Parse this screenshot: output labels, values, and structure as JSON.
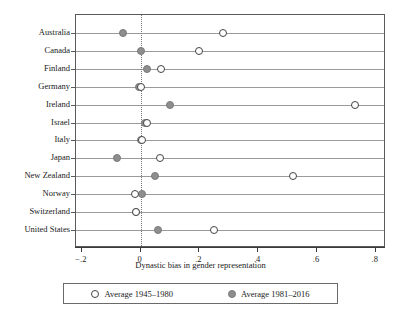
{
  "chart_data": {
    "type": "scatter",
    "title": "",
    "xlabel": "Dynastic bias in gender representation",
    "ylabel": "",
    "xlim": [
      -0.22,
      0.835
    ],
    "grid": true,
    "legend_position": "bottom",
    "categories": [
      "Australia",
      "Canada",
      "Finland",
      "Germany",
      "Ireland",
      "Israel",
      "Italy",
      "Japan",
      "New Zealand",
      "Norway",
      "Switzerland",
      "United States"
    ],
    "series": [
      {
        "name": "Average 1945–1980",
        "marker": "open-circle",
        "color": "#ffffff",
        "edge_color": "#444444",
        "values": [
          0.28,
          0.2,
          0.07,
          0.0,
          0.73,
          0.02,
          0.005,
          0.065,
          0.52,
          -0.02,
          -0.015,
          0.25
        ]
      },
      {
        "name": "Average 1981–2016",
        "marker": "filled-circle",
        "color": "#8e8e8e",
        "edge_color": "#7a7a7a",
        "values": [
          -0.06,
          0.0,
          0.02,
          -0.005,
          0.1,
          0.015,
          0.0,
          -0.08,
          0.05,
          0.005,
          -0.015,
          0.06
        ]
      }
    ],
    "xticks": [
      -0.2,
      0,
      0.2,
      0.4,
      0.6,
      0.8
    ],
    "xticklabels": [
      "−.2",
      "0",
      ".2",
      ".4",
      ".6",
      ".8"
    ],
    "reference_line": {
      "value": 0,
      "style": "dotted",
      "color": "#777777"
    }
  },
  "legend": {
    "entries": [
      {
        "label": "Average 1945–1980",
        "marker": "open-circle"
      },
      {
        "label": "Average 1981–2016",
        "marker": "filled-circle"
      }
    ]
  },
  "colors": {
    "frame": "#5a5a5a",
    "row_line": "#9a9a9a",
    "filled_marker": "#8e8e8e",
    "open_marker_edge": "#444444",
    "zero_line": "#777777",
    "text": "#1a1a1a"
  }
}
